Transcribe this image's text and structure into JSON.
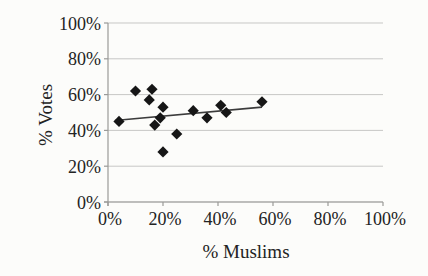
{
  "chart_data": {
    "type": "scatter",
    "title": "",
    "xlabel": "% Muslims",
    "ylabel": "% Votes",
    "xlim": [
      0,
      100
    ],
    "ylim": [
      0,
      100
    ],
    "x_ticks": [
      "0%",
      "20%",
      "40%",
      "60%",
      "80%",
      "100%"
    ],
    "y_ticks": [
      "0%",
      "20%",
      "40%",
      "60%",
      "80%",
      "100%"
    ],
    "x_tick_values": [
      0,
      20,
      40,
      60,
      80,
      100
    ],
    "y_tick_values": [
      0,
      20,
      40,
      60,
      80,
      100
    ],
    "grid": "horizontal",
    "legend": "none",
    "series": [
      {
        "name": "data-points",
        "marker": "diamond",
        "color": "#161616",
        "points": [
          [
            4,
            45
          ],
          [
            10,
            62
          ],
          [
            15,
            57
          ],
          [
            16,
            63
          ],
          [
            17,
            43
          ],
          [
            19,
            47
          ],
          [
            20,
            53
          ],
          [
            20,
            28
          ],
          [
            25,
            38
          ],
          [
            31,
            51
          ],
          [
            36,
            47
          ],
          [
            41,
            54
          ],
          [
            43,
            50
          ],
          [
            56,
            56
          ]
        ]
      }
    ],
    "trendline": {
      "x1": 2.5,
      "y1": 45.5,
      "x2": 56,
      "y2": 53
    }
  },
  "colors": {
    "background": "#fcfcfa",
    "grid": "#c7c7c5",
    "axis": "#9a9a98",
    "text": "#232323",
    "marker": "#161616",
    "trend": "#3c3c3c"
  }
}
